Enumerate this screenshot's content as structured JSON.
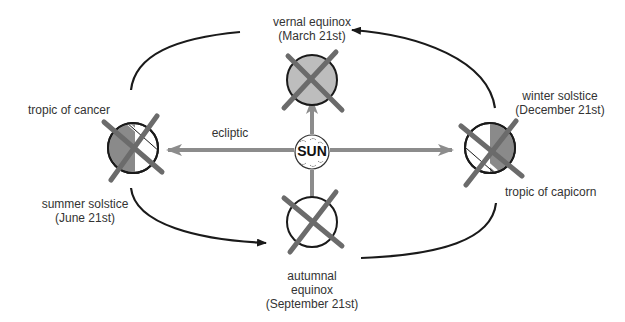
{
  "sun": {
    "label": "SUN"
  },
  "ecliptic": {
    "label": "ecliptic"
  },
  "positions": {
    "vernal": {
      "line1": "vernal equinox",
      "line2": "(March 21st)"
    },
    "summer": {
      "line1": "summer solstice",
      "line2": "(June 21st)",
      "tropic": "tropic of cancer"
    },
    "autumnal": {
      "line1": "autumnal",
      "line2": "equinox",
      "line3": "(September 21st)"
    },
    "winter": {
      "line1": "winter solstice",
      "line2": "(December 21st)",
      "tropic": "tropic of capicorn"
    }
  },
  "colors": {
    "globe_fill": "#bdbdbd",
    "shade_dark": "#8a8a8a",
    "axis": "#6b6b6b",
    "ray": "#8c8c8c",
    "orbit": "#1a1a1a"
  }
}
